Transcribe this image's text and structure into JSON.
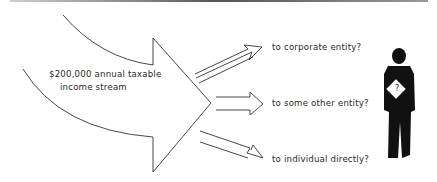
{
  "diagram": {
    "source": {
      "line1": "$200,000 annual taxable",
      "line2": "income stream"
    },
    "destinations": [
      {
        "label": "to corporate entity?"
      },
      {
        "label": "to some other entity?"
      },
      {
        "label": "to individual directly?"
      }
    ],
    "figure": {
      "sign_text": "?"
    },
    "colors": {
      "stroke": "#333333",
      "figure": "#111111"
    }
  }
}
